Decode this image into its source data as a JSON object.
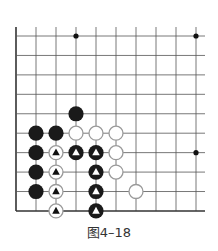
{
  "diagram": {
    "caption": "图4–18",
    "grid": {
      "cols": 10,
      "rows": 10,
      "origin_x": 16,
      "origin_y": 36,
      "spacing_x": 20,
      "spacing_y": 19.44,
      "line_top": 27,
      "line_right": 205,
      "line_color": "#555555",
      "edge_left": true,
      "edge_bottom": true
    },
    "star_points": [
      {
        "col": 3,
        "row": 0
      },
      {
        "col": 9,
        "row": 0
      },
      {
        "col": 9,
        "row": 6
      }
    ],
    "stones": [
      {
        "col": 3,
        "row": 4,
        "color": "black",
        "marker": null
      },
      {
        "col": 1,
        "row": 5,
        "color": "black",
        "marker": null
      },
      {
        "col": 2,
        "row": 5,
        "color": "black",
        "marker": null
      },
      {
        "col": 3,
        "row": 5,
        "color": "white",
        "marker": null
      },
      {
        "col": 4,
        "row": 5,
        "color": "white",
        "marker": null
      },
      {
        "col": 5,
        "row": 5,
        "color": "white",
        "marker": null
      },
      {
        "col": 1,
        "row": 6,
        "color": "black",
        "marker": null
      },
      {
        "col": 2,
        "row": 6,
        "color": "white",
        "marker": "triangle"
      },
      {
        "col": 3,
        "row": 6,
        "color": "black",
        "marker": "triangle"
      },
      {
        "col": 4,
        "row": 6,
        "color": "black",
        "marker": "triangle"
      },
      {
        "col": 5,
        "row": 6,
        "color": "white",
        "marker": null
      },
      {
        "col": 1,
        "row": 7,
        "color": "black",
        "marker": null
      },
      {
        "col": 2,
        "row": 7,
        "color": "white",
        "marker": "triangle"
      },
      {
        "col": 4,
        "row": 7,
        "color": "black",
        "marker": "triangle"
      },
      {
        "col": 5,
        "row": 7,
        "color": "white",
        "marker": null
      },
      {
        "col": 1,
        "row": 8,
        "color": "black",
        "marker": null
      },
      {
        "col": 2,
        "row": 8,
        "color": "white",
        "marker": "triangle"
      },
      {
        "col": 4,
        "row": 8,
        "color": "black",
        "marker": "triangle"
      },
      {
        "col": 6,
        "row": 8,
        "color": "white",
        "marker": null
      },
      {
        "col": 2,
        "row": 9,
        "color": "white",
        "marker": "triangle"
      },
      {
        "col": 4,
        "row": 9,
        "color": "black",
        "marker": "triangle"
      }
    ],
    "colors": {
      "black_stone": "#1a1a1a",
      "white_stone_fill": "#ffffff",
      "white_stone_stroke": "#9a9a9a",
      "star_point": "#111111"
    }
  }
}
